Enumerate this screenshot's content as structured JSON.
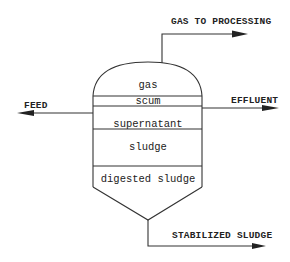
{
  "diagram": {
    "type": "anaerobic digester schematic",
    "flows": {
      "gas_out": "GAS TO PROCESSING",
      "feed": "FEED",
      "effluent": "EFFLUENT",
      "sludge_out": "STABILIZED SLUDGE"
    },
    "layers": [
      "gas",
      "scum",
      "supernatant",
      "sludge",
      "digested sludge"
    ]
  }
}
